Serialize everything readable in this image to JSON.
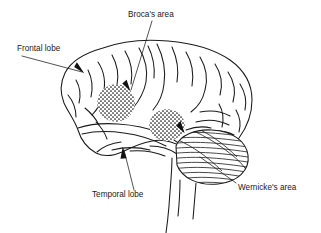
{
  "figure": {
    "background_color": "#ffffff",
    "ink_color": "#1a1a1a"
  },
  "labels": {
    "brocas_area": "Broca's area",
    "frontal_lobe": "Frontal lobe",
    "temporal_lobe": "Temporal lobe",
    "wernickes_area": "Wernicke's area"
  },
  "annotations": [
    {
      "id": "brocas-area",
      "text": "Broca's area",
      "text_x": 128,
      "text_y": 17,
      "anchor": "start",
      "leader": "M 152 21 L 131 90",
      "arrow": true,
      "arrow_x": 131,
      "arrow_y": 90,
      "arrow_angle": 110
    },
    {
      "id": "frontal-lobe",
      "text": "Frontal lobe",
      "text_x": 17,
      "text_y": 51,
      "anchor": "start",
      "leader": "M 22 56 L 82 72",
      "arrow": true,
      "arrow_x": 84,
      "arrow_y": 72,
      "arrow_angle": 15
    },
    {
      "id": "temporal-lobe",
      "text": "Temporal lobe",
      "text_x": 92,
      "text_y": 196,
      "anchor": "start",
      "leader": "M 134 190 L 124 150",
      "arrow": true,
      "arrow_x": 123,
      "arrow_y": 148,
      "arrow_angle": -104
    },
    {
      "id": "wernickes-area",
      "text": "Wernicke's area",
      "text_x": 238,
      "text_y": 190,
      "anchor": "start",
      "leader": "M 236 183 L 200 157",
      "arrow": false
    },
    {
      "id": "wernickes-arrow-on-cortex",
      "text": "",
      "leader": "",
      "arrow": true,
      "arrow_x": 184,
      "arrow_y": 132,
      "arrow_angle": 68
    }
  ],
  "regions": [
    {
      "id": "brocas-stipple",
      "name": "Broca's area stipple patch",
      "cx": 116,
      "cy": 103,
      "rx": 19,
      "ry": 19
    },
    {
      "id": "wernickes-stipple",
      "name": "Wernicke's area stipple patch",
      "cx": 167,
      "cy": 125,
      "rx": 18,
      "ry": 16
    }
  ],
  "structures": {
    "cerebrum": "cerebral cortex outline with gyri and sulci",
    "cerebellum": "cerebellum with horizontal folia striations",
    "brainstem": "brainstem descending below the cerebellum"
  }
}
